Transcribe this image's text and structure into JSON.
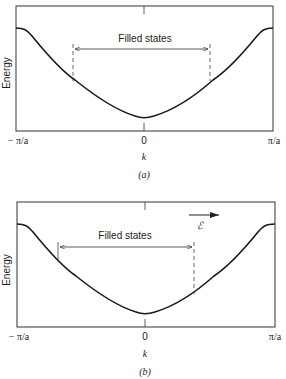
{
  "panels": [
    {
      "id": "a",
      "caption": "(a)",
      "ylabel": "Energy",
      "xlabel": "k",
      "ticks": {
        "left": "− π/a",
        "center": "0",
        "right": "π/a"
      },
      "annotation": "Filled states",
      "filled_range": {
        "kmin_frac": -0.55,
        "kmax_frac": 0.55
      },
      "field_label": ""
    },
    {
      "id": "b",
      "caption": "(b)",
      "ylabel": "Energy",
      "xlabel": "k",
      "ticks": {
        "left": "− π/a",
        "center": "0",
        "right": "π/a"
      },
      "annotation": "Filled states",
      "filled_range": {
        "kmin_frac": -0.65,
        "kmax_frac": 0.45
      },
      "field_label": "ℰ"
    }
  ],
  "colors": {
    "line": "#1a1a1a",
    "frame": "#333333",
    "dash": "#444444"
  }
}
